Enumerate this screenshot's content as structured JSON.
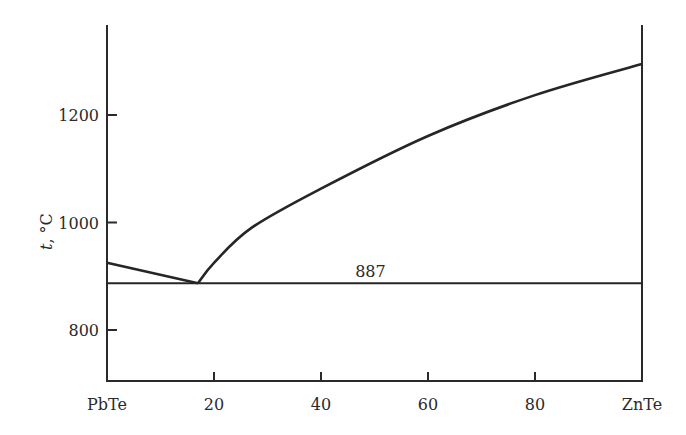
{
  "chart_data": {
    "type": "line",
    "title": "",
    "xlabel": "",
    "ylabel": "t, °C",
    "x_tick_labels": [
      "PbTe",
      "20",
      "40",
      "60",
      "80",
      "ZnTe"
    ],
    "x_ticks": [
      0,
      20,
      40,
      60,
      80,
      100
    ],
    "y_tick_labels": [
      "800",
      "1000",
      "1200"
    ],
    "y_ticks": [
      800,
      1000,
      1200
    ],
    "xlim": [
      0,
      100
    ],
    "ylim": [
      710,
      1365
    ],
    "grid": false,
    "legend": null,
    "annotations": [
      {
        "text": "887",
        "x": 52,
        "y": 887
      }
    ],
    "series": [
      {
        "name": "liquidus (PbTe side)",
        "x": [
          0,
          17
        ],
        "values": [
          925,
          887
        ]
      },
      {
        "name": "liquidus (ZnTe side)",
        "x": [
          17,
          20,
          27,
          40,
          60,
          80,
          100
        ],
        "values": [
          887,
          925,
          990,
          1063,
          1161,
          1237,
          1295
        ]
      },
      {
        "name": "eutectic line",
        "x": [
          0,
          100
        ],
        "values": [
          887,
          887
        ]
      }
    ]
  }
}
